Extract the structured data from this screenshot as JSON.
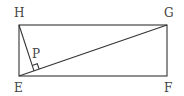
{
  "figure": {
    "type": "geometry",
    "line_color": "#333333",
    "label_color": "#444444",
    "points": {
      "H": {
        "label": "H",
        "x": 19,
        "y": 25
      },
      "G": {
        "label": "G",
        "x": 167,
        "y": 25
      },
      "E": {
        "label": "E",
        "x": 19,
        "y": 76
      },
      "F": {
        "label": "F",
        "x": 167,
        "y": 76
      },
      "P": {
        "label": "P",
        "x": 34,
        "y": 70
      }
    },
    "labels": {
      "H": "H",
      "G": "G",
      "E": "E",
      "F": "F",
      "P": "P"
    },
    "right_angle_at": "P"
  }
}
